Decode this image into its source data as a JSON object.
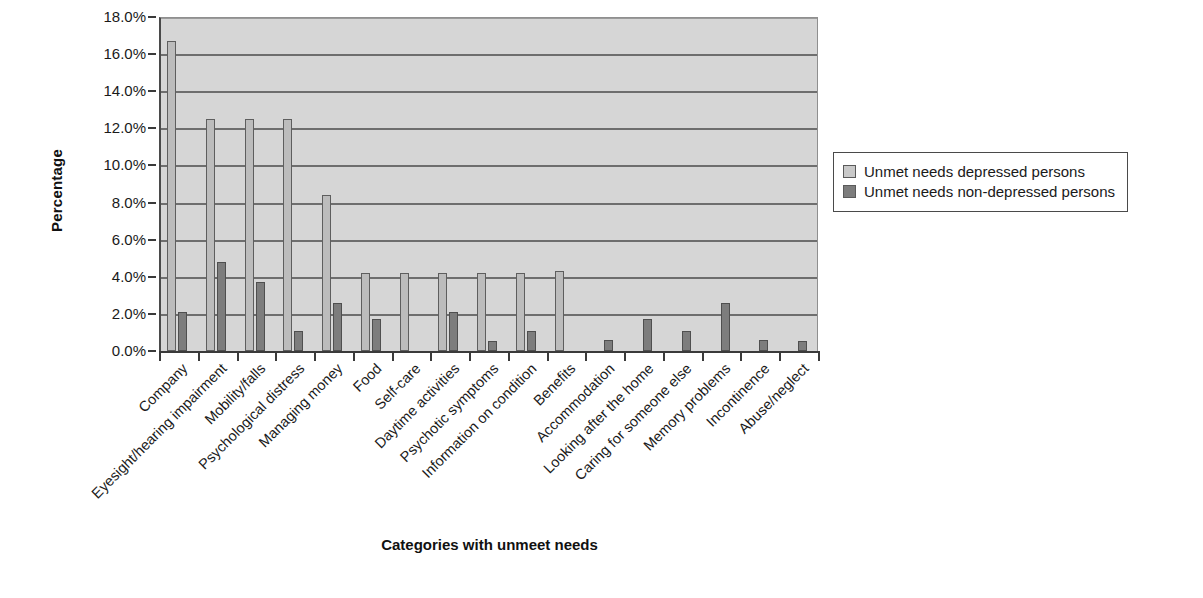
{
  "chart_data": {
    "type": "bar",
    "title": "",
    "xlabel": "Categories with unmeet needs",
    "ylabel": "Percentage",
    "ylim": [
      0,
      18
    ],
    "ytick_step": 2,
    "ytick_labels": [
      "0.0%",
      "2.0%",
      "4.0%",
      "6.0%",
      "8.0%",
      "10.0%",
      "12.0%",
      "14.0%",
      "16.0%",
      "18.0%"
    ],
    "grid": "horizontal",
    "legend_position": "right",
    "categories": [
      "Company",
      "Eyesight/hearing impairment",
      "Mobility/falls",
      "Psychological distress",
      "Managing money",
      "Food",
      "Self-care",
      "Daytime activities",
      "Psychotic symptoms",
      "Information on condition",
      "Benefits",
      "Accommodation",
      "Looking after the home",
      "Caring for someone else",
      "Memory problems",
      "Incontinence",
      "Abuse/neglect"
    ],
    "series": [
      {
        "name": "Unmet needs depressed persons",
        "color": "#bcbcbc",
        "values": [
          16.7,
          12.5,
          12.5,
          12.5,
          8.4,
          4.2,
          4.2,
          4.2,
          4.2,
          4.2,
          4.3,
          0,
          0,
          0,
          0,
          0,
          0
        ]
      },
      {
        "name": "Unmet needs non-depressed persons",
        "color": "#7d7d7d",
        "values": [
          2.1,
          4.8,
          3.7,
          1.1,
          2.6,
          1.7,
          0,
          2.1,
          0.55,
          1.1,
          0,
          0.6,
          1.7,
          1.1,
          2.6,
          0.6,
          0.55
        ]
      }
    ]
  },
  "legend": {
    "items": [
      {
        "label": "Unmet needs depressed persons",
        "swatch": "s0"
      },
      {
        "label": "Unmet needs non-depressed persons",
        "swatch": "s1"
      }
    ]
  },
  "caption": {
    "text": ""
  },
  "colors": {
    "plot_background": "#d6d6d6",
    "gridline": "#6e6e6e",
    "axis": "#3a3a3a",
    "series_light": "#bcbcbc",
    "series_dark": "#7d7d7d"
  }
}
